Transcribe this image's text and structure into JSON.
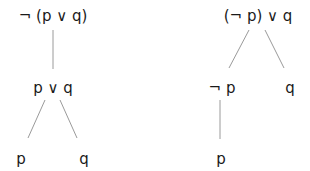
{
  "trees": [
    {
      "name": "left",
      "nodes": [
        {
          "id": "root",
          "label": "¬ (p ∨ q)",
          "x": 53,
          "y": 7
        },
        {
          "id": "or",
          "label": "p ∨ q",
          "x": 53,
          "y": 79
        },
        {
          "id": "p",
          "label": "p",
          "x": 21,
          "y": 150
        },
        {
          "id": "q",
          "label": "q",
          "x": 84,
          "y": 150
        }
      ],
      "edges": [
        {
          "x1": 53,
          "y1": 30,
          "x2": 53,
          "y2": 69
        },
        {
          "x1": 45,
          "y1": 100,
          "x2": 28,
          "y2": 138
        },
        {
          "x1": 60,
          "y1": 100,
          "x2": 77,
          "y2": 138
        }
      ]
    },
    {
      "name": "right",
      "nodes": [
        {
          "id": "root",
          "label": "(¬ p) ∨ q",
          "x": 258,
          "y": 7
        },
        {
          "id": "notp",
          "label": "¬ p",
          "x": 222,
          "y": 79
        },
        {
          "id": "q",
          "label": "q",
          "x": 290,
          "y": 79
        },
        {
          "id": "p",
          "label": "p",
          "x": 221,
          "y": 150
        }
      ],
      "edges": [
        {
          "x1": 249,
          "y1": 30,
          "x2": 229,
          "y2": 68
        },
        {
          "x1": 265,
          "y1": 30,
          "x2": 284,
          "y2": 68
        },
        {
          "x1": 220,
          "y1": 100,
          "x2": 220,
          "y2": 139
        }
      ]
    }
  ],
  "colors": {
    "edge": "#9a9a9a",
    "text": "#1a1a1a"
  }
}
